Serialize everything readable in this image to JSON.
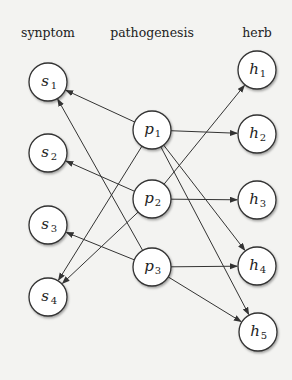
{
  "headers": {
    "symptom": "synptom",
    "pathogenesis": "pathogenesis",
    "herb": "herb"
  },
  "nodes": [
    {
      "id": "s1",
      "letter": "s",
      "sub": "1",
      "x": 48,
      "y": 82
    },
    {
      "id": "s2",
      "letter": "s",
      "sub": "2",
      "x": 48,
      "y": 153
    },
    {
      "id": "s3",
      "letter": "s",
      "sub": "3",
      "x": 48,
      "y": 225
    },
    {
      "id": "s4",
      "letter": "s",
      "sub": "4",
      "x": 48,
      "y": 297
    },
    {
      "id": "p1",
      "letter": "p",
      "sub": "1",
      "x": 152,
      "y": 130
    },
    {
      "id": "p2",
      "letter": "p",
      "sub": "2",
      "x": 152,
      "y": 199
    },
    {
      "id": "p3",
      "letter": "p",
      "sub": "3",
      "x": 152,
      "y": 267
    },
    {
      "id": "h1",
      "letter": "h",
      "sub": "1",
      "x": 257,
      "y": 70
    },
    {
      "id": "h2",
      "letter": "h",
      "sub": "2",
      "x": 257,
      "y": 134
    },
    {
      "id": "h3",
      "letter": "h",
      "sub": "3",
      "x": 257,
      "y": 200
    },
    {
      "id": "h4",
      "letter": "h",
      "sub": "4",
      "x": 257,
      "y": 266
    },
    {
      "id": "h5",
      "letter": "h",
      "sub": "5",
      "x": 258,
      "y": 332
    }
  ],
  "edges": [
    {
      "from": "p1",
      "to": "s1"
    },
    {
      "from": "p1",
      "to": "s4"
    },
    {
      "from": "p1",
      "to": "h2"
    },
    {
      "from": "p1",
      "to": "h4"
    },
    {
      "from": "p1",
      "to": "h5"
    },
    {
      "from": "p2",
      "to": "s2"
    },
    {
      "from": "p2",
      "to": "s4"
    },
    {
      "from": "p2",
      "to": "h1"
    },
    {
      "from": "p2",
      "to": "h3"
    },
    {
      "from": "p3",
      "to": "s1"
    },
    {
      "from": "p3",
      "to": "s3"
    },
    {
      "from": "p3",
      "to": "h4"
    },
    {
      "from": "p3",
      "to": "h5"
    }
  ],
  "style": {
    "node_radius": 19,
    "stroke": "#333333",
    "fill": "#ffffff",
    "background": "#f3f3f1"
  }
}
